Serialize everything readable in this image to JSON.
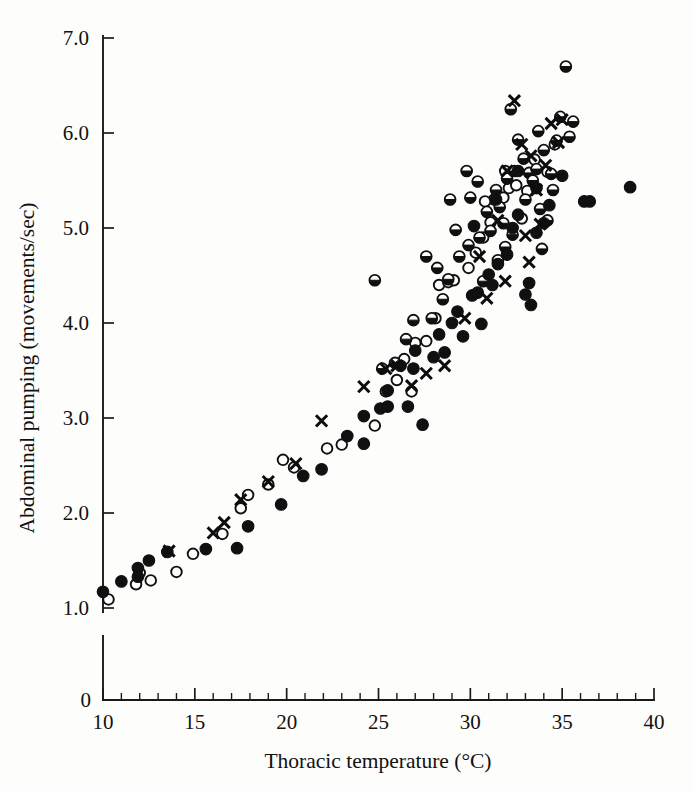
{
  "figure": {
    "background_color": "#fdfdfb",
    "ink_color": "#101010",
    "caption_present": false
  },
  "chart_data": {
    "type": "scatter",
    "title": "",
    "xlabel": "Thoracic temperature (°C)",
    "ylabel": "Abdominal pumping (movements/sec)",
    "xlim": [
      10,
      40
    ],
    "ylim": [
      0.85,
      7.0
    ],
    "grid": false,
    "legend_position": "none",
    "x_ticks_major": [
      10,
      15,
      20,
      25,
      30,
      35,
      40
    ],
    "x_tick_labels": [
      "10",
      "15",
      "20",
      "25",
      "30",
      "35",
      "40"
    ],
    "x_minor_tick_step": 1,
    "y_ticks_major": [
      1.0,
      2.0,
      3.0,
      4.0,
      5.0,
      6.0,
      7.0
    ],
    "y_tick_labels": [
      "1.0",
      "2.0",
      "3.0",
      "4.0",
      "5.0",
      "6.0",
      "7.0"
    ],
    "y_origin_label": "0",
    "y_axis_break": true,
    "marker_styles": {
      "filled": "filled-circle",
      "open": "open-circle",
      "half": "half-filled-circle",
      "cross": "x-cross"
    },
    "series": [
      {
        "name": "filled",
        "marker": "filled-circle",
        "points": [
          [
            10.0,
            1.17
          ],
          [
            11.0,
            1.28
          ],
          [
            11.9,
            1.42
          ],
          [
            11.9,
            1.33
          ],
          [
            12.5,
            1.5
          ],
          [
            13.5,
            1.59
          ],
          [
            15.6,
            1.62
          ],
          [
            17.3,
            1.63
          ],
          [
            17.9,
            1.86
          ],
          [
            19.7,
            2.09
          ],
          [
            20.9,
            2.39
          ],
          [
            21.9,
            2.46
          ],
          [
            23.3,
            2.81
          ],
          [
            24.2,
            3.02
          ],
          [
            24.2,
            2.73
          ],
          [
            25.1,
            3.1
          ],
          [
            25.5,
            3.29
          ],
          [
            25.5,
            3.12
          ],
          [
            26.2,
            3.55
          ],
          [
            26.9,
            3.52
          ],
          [
            26.6,
            3.12
          ],
          [
            27.0,
            3.71
          ],
          [
            27.4,
            2.93
          ],
          [
            28.0,
            3.64
          ],
          [
            28.3,
            3.88
          ],
          [
            28.6,
            3.69
          ],
          [
            29.0,
            4.0
          ],
          [
            29.3,
            4.12
          ],
          [
            29.6,
            3.86
          ],
          [
            30.1,
            4.29
          ],
          [
            30.4,
            4.32
          ],
          [
            30.6,
            3.99
          ],
          [
            31.0,
            4.51
          ],
          [
            31.2,
            4.4
          ],
          [
            31.5,
            4.62
          ],
          [
            32.0,
            4.72
          ],
          [
            32.3,
            5.0
          ],
          [
            32.6,
            5.14
          ],
          [
            33.0,
            4.3
          ],
          [
            33.2,
            4.42
          ],
          [
            33.3,
            4.19
          ],
          [
            33.6,
            4.95
          ],
          [
            34.0,
            5.05
          ],
          [
            34.3,
            5.24
          ],
          [
            35.0,
            5.55
          ],
          [
            36.2,
            5.28
          ],
          [
            36.5,
            5.28
          ],
          [
            38.7,
            5.43
          ],
          [
            33.6,
            5.42
          ],
          [
            32.6,
            5.6
          ],
          [
            31.4,
            5.3
          ],
          [
            30.2,
            5.02
          ]
        ]
      },
      {
        "name": "open",
        "marker": "open-circle",
        "points": [
          [
            10.3,
            1.09
          ],
          [
            11.8,
            1.25
          ],
          [
            12.0,
            1.37
          ],
          [
            12.6,
            1.29
          ],
          [
            14.0,
            1.38
          ],
          [
            14.9,
            1.57
          ],
          [
            16.5,
            1.78
          ],
          [
            17.5,
            2.05
          ],
          [
            17.9,
            2.19
          ],
          [
            19.0,
            2.3
          ],
          [
            19.8,
            2.56
          ],
          [
            20.4,
            2.48
          ],
          [
            22.2,
            2.68
          ],
          [
            23.0,
            2.72
          ],
          [
            24.8,
            2.92
          ],
          [
            25.4,
            3.28
          ],
          [
            26.0,
            3.4
          ],
          [
            26.4,
            3.62
          ],
          [
            27.0,
            3.79
          ],
          [
            27.6,
            3.81
          ],
          [
            28.1,
            4.05
          ],
          [
            28.3,
            4.4
          ],
          [
            28.8,
            4.43
          ],
          [
            29.1,
            4.45
          ],
          [
            29.9,
            4.58
          ],
          [
            30.3,
            4.74
          ],
          [
            30.7,
            4.9
          ],
          [
            31.1,
            5.06
          ],
          [
            31.3,
            5.3
          ],
          [
            31.8,
            5.32
          ],
          [
            32.1,
            5.42
          ],
          [
            32.5,
            5.45
          ],
          [
            32.8,
            5.1
          ],
          [
            33.1,
            5.39
          ],
          [
            33.5,
            5.72
          ],
          [
            34.2,
            5.59
          ],
          [
            34.6,
            5.88
          ],
          [
            31.9,
            5.6
          ],
          [
            30.8,
            5.28
          ],
          [
            26.8,
            3.28
          ]
        ]
      },
      {
        "name": "half",
        "marker": "half-filled-circle",
        "points": [
          [
            24.8,
            4.45
          ],
          [
            27.6,
            4.7
          ],
          [
            28.9,
            5.3
          ],
          [
            29.8,
            5.6
          ],
          [
            30.4,
            5.49
          ],
          [
            30.9,
            5.17
          ],
          [
            31.1,
            4.97
          ],
          [
            31.4,
            5.4
          ],
          [
            31.6,
            5.22
          ],
          [
            31.8,
            5.05
          ],
          [
            32.0,
            5.52
          ],
          [
            32.2,
            6.25
          ],
          [
            32.4,
            5.6
          ],
          [
            32.6,
            5.93
          ],
          [
            32.9,
            5.73
          ],
          [
            33.0,
            5.3
          ],
          [
            33.2,
            5.58
          ],
          [
            33.4,
            5.5
          ],
          [
            33.6,
            5.62
          ],
          [
            33.8,
            5.2
          ],
          [
            34.0,
            5.82
          ],
          [
            34.2,
            5.08
          ],
          [
            34.4,
            5.57
          ],
          [
            34.7,
            5.92
          ],
          [
            34.9,
            6.17
          ],
          [
            35.2,
            6.7
          ],
          [
            35.4,
            5.96
          ],
          [
            35.6,
            6.12
          ],
          [
            30.5,
            4.9
          ],
          [
            29.9,
            4.82
          ],
          [
            29.4,
            4.7
          ],
          [
            28.8,
            4.46
          ],
          [
            28.5,
            4.25
          ],
          [
            27.9,
            4.05
          ],
          [
            26.9,
            4.03
          ],
          [
            26.5,
            3.83
          ],
          [
            25.9,
            3.58
          ],
          [
            25.2,
            3.52
          ],
          [
            30.0,
            5.32
          ],
          [
            33.9,
            4.78
          ],
          [
            32.3,
            4.93
          ],
          [
            31.9,
            4.8
          ],
          [
            31.5,
            4.66
          ],
          [
            30.7,
            4.44
          ],
          [
            33.7,
            6.02
          ],
          [
            34.5,
            5.4
          ],
          [
            29.2,
            4.98
          ],
          [
            28.2,
            4.58
          ]
        ]
      },
      {
        "name": "cross",
        "marker": "x-cross",
        "points": [
          [
            13.6,
            1.6
          ],
          [
            16.0,
            1.79
          ],
          [
            16.6,
            1.9
          ],
          [
            17.5,
            2.14
          ],
          [
            19.0,
            2.33
          ],
          [
            20.5,
            2.52
          ],
          [
            21.9,
            2.97
          ],
          [
            24.2,
            3.33
          ],
          [
            25.4,
            3.52
          ],
          [
            26.0,
            3.55
          ],
          [
            26.8,
            3.34
          ],
          [
            27.6,
            3.47
          ],
          [
            28.6,
            3.55
          ],
          [
            29.7,
            4.05
          ],
          [
            30.5,
            4.7
          ],
          [
            31.5,
            5.08
          ],
          [
            32.0,
            5.6
          ],
          [
            32.4,
            6.34
          ],
          [
            32.8,
            5.88
          ],
          [
            33.0,
            4.92
          ],
          [
            33.3,
            5.76
          ],
          [
            33.6,
            5.4
          ],
          [
            33.8,
            5.04
          ],
          [
            34.1,
            5.66
          ],
          [
            34.4,
            6.1
          ],
          [
            34.8,
            5.9
          ],
          [
            35.0,
            6.14
          ],
          [
            30.9,
            4.26
          ],
          [
            31.9,
            4.44
          ],
          [
            33.2,
            4.64
          ]
        ]
      }
    ]
  }
}
